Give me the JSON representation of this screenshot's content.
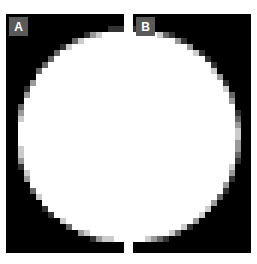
{
  "figure": {
    "width": 257,
    "height": 264,
    "background_color": "#ffffff"
  },
  "style": {
    "panel_background_color": "#000000",
    "object_color": "#ffffff",
    "label_badge_color": "#5a5a5a",
    "label_text_color": "#ffffff",
    "label_font_size_px": 12,
    "label_badge_width_px": 19,
    "label_badge_height_px": 19,
    "pixel_block_size_px": 6,
    "antialias_levels": [
      "#000000",
      "#3d3d3d",
      "#777777",
      "#b4b4b4",
      "#e0e0e0",
      "#ffffff"
    ]
  },
  "panels": [
    {
      "id": "panel-a",
      "label": "A",
      "x": 6,
      "y": 14,
      "width": 118,
      "height": 239,
      "label_x": 3,
      "label_y": 3,
      "shape": {
        "type": "disc",
        "center_x": 118,
        "center_y": 122,
        "radius": 106,
        "clipped_edge": "right"
      }
    },
    {
      "id": "panel-b",
      "label": "B",
      "x": 133,
      "y": 14,
      "width": 118,
      "height": 239,
      "label_x": 3,
      "label_y": 3,
      "shape": {
        "type": "disc",
        "center_x": 0,
        "center_y": 122,
        "radius": 106,
        "clipped_edge": "left"
      }
    }
  ]
}
